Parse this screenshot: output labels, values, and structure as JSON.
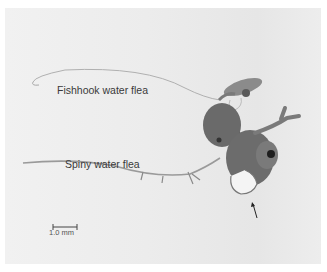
{
  "figure": {
    "labels": {
      "fishhook": "Fishhook water flea",
      "spiny": "Spiny water flea"
    },
    "scale_bar": {
      "label": "1.0 mm"
    },
    "arrows": [
      "arrow-fishhook",
      "arrow-spiny"
    ],
    "colors": {
      "background": "#ececec",
      "specimen": "#6a6a6a",
      "text": "#3a3a3a"
    }
  }
}
